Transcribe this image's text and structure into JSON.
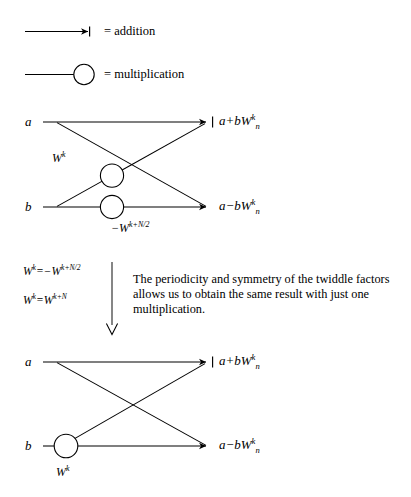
{
  "page": {
    "background_color": "#ffffff",
    "ink_color": "#000000",
    "width": 411,
    "height": 497
  },
  "legend": {
    "items": [
      {
        "icon": "arrow-right-icon",
        "symbol_kind": "arrow",
        "label": "= addition"
      },
      {
        "icon": "circle-outline-icon",
        "symbol_kind": "circle",
        "label": "= multiplication"
      }
    ]
  },
  "diagram_top": {
    "name": "butterfly-two-multipliers",
    "inputs": [
      {
        "label": "a"
      },
      {
        "label": "b"
      }
    ],
    "outputs": [
      {
        "label_html": "a+bW<sup>k</sup><sub>n</sub>",
        "plain": "a+bW^k_n"
      },
      {
        "label_html": "a−bW<sup>k</sup><sub>n</sub>",
        "plain": "a-bW^k_n"
      }
    ],
    "multipliers": [
      {
        "label_html": "W<sup>k</sup>",
        "plain": "W^k"
      },
      {
        "label_html": "−W<sup>k+N/2</sup>",
        "plain": "-W^(k+N/2)"
      }
    ]
  },
  "middle": {
    "equations": [
      {
        "html": "W<sup>k</sup>=−W<sup>k+N/2</sup>",
        "plain": "W^k = -W^(k+N/2)"
      },
      {
        "html": "W<sup>k</sup>=W<sup>k+N</sup>",
        "plain": "W^k = W^(k+N)"
      }
    ],
    "divider_arrow": "arrow-down-icon",
    "note": "The periodicity and symmetry of the twiddle factors allows us to obtain the same result with just one multiplication."
  },
  "diagram_bottom": {
    "name": "butterfly-one-multiplier",
    "inputs": [
      {
        "label": "a"
      },
      {
        "label": "b"
      }
    ],
    "outputs": [
      {
        "label_html": "a+bW<sup>k</sup><sub>n</sub>",
        "plain": "a+bW^k_n"
      },
      {
        "label_html": "a−bW<sup>k</sup><sub>n</sub>",
        "plain": "a-bW^k_n"
      }
    ],
    "multipliers": [
      {
        "label_html": "W<sup>k</sup>",
        "plain": "W^k"
      }
    ]
  }
}
